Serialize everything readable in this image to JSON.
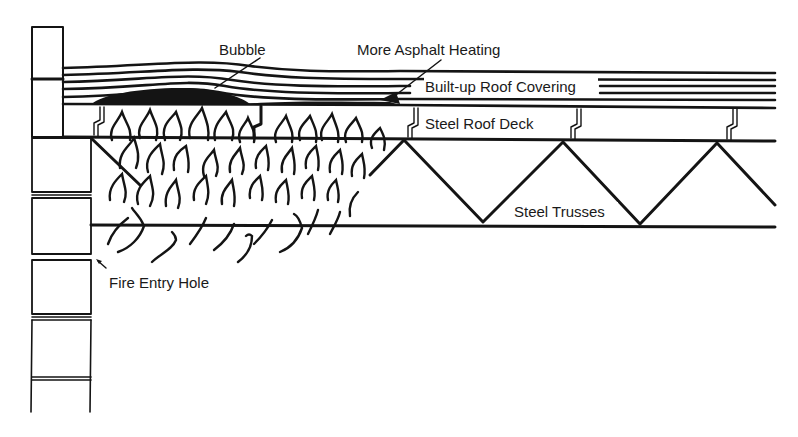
{
  "diagram": {
    "colors": {
      "ink": "#141414",
      "background": "#ffffff"
    },
    "labels": {
      "bubble": "Bubble",
      "asphalt": "More Asphalt Heating",
      "roof_covering": "Built-up Roof Covering",
      "roof_deck": "Steel Roof Deck",
      "trusses": "Steel Trusses",
      "fire_entry": "Fire Entry Hole"
    },
    "components": [
      "masonry-wall",
      "built-up-roof-covering",
      "asphalt-bubble",
      "steel-roof-deck",
      "steel-trusses",
      "flames",
      "fire-entry-hole"
    ]
  }
}
